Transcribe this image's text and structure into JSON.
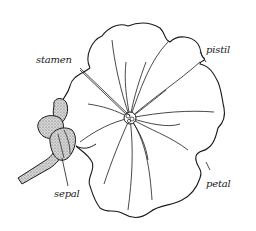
{
  "diagram": {
    "labels": [
      {
        "id": "stamen",
        "text": "stamen"
      },
      {
        "id": "pistil",
        "text": "pistil"
      },
      {
        "id": "sepal",
        "text": "sepal"
      },
      {
        "id": "petal",
        "text": "petal"
      }
    ],
    "colors": {
      "ink": "#1a1a1a",
      "background": "#ffffff",
      "stipple": "#9a9a9a"
    }
  }
}
